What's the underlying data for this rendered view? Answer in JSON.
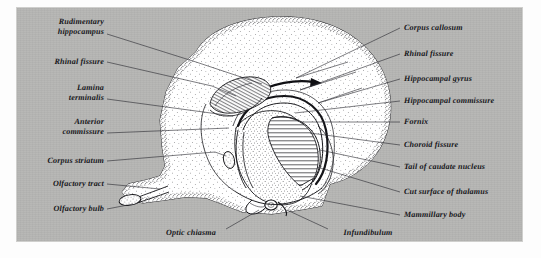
{
  "figure": {
    "plate_color": "#b6b6b4",
    "ink_color": "#16161a",
    "paper_color": "#fdfdfd"
  },
  "labels_left": [
    {
      "id": "rudimentary-hippocampus",
      "text": "Rudimentary",
      "text2": "hippocampus",
      "x": 104,
      "y": 22,
      "lx1": 107,
      "ly1": 34,
      "lx2": 196,
      "ly2": 62
    },
    {
      "id": "rhinal-fissure-left",
      "text": "Rhinal  fissure",
      "text2": "",
      "x": 104,
      "y": 62,
      "lx1": 107,
      "ly1": 62,
      "lx2": 212,
      "ly2": 86
    },
    {
      "id": "lamina-terminalis",
      "text": "Lamina",
      "text2": "terminalis",
      "x": 104,
      "y": 88,
      "lx1": 107,
      "ly1": 99,
      "lx2": 233,
      "ly2": 116
    },
    {
      "id": "anterior-commissure",
      "text": "Anterior",
      "text2": "commissure",
      "x": 104,
      "y": 122,
      "lx1": 107,
      "ly1": 133,
      "lx2": 229,
      "ly2": 128
    },
    {
      "id": "corpus-striatum",
      "text": "Corpus  striatum",
      "text2": "",
      "x": 104,
      "y": 161,
      "lx1": 107,
      "ly1": 161,
      "lx2": 215,
      "ly2": 152
    },
    {
      "id": "olfactory-tract",
      "text": "Olfactory  tract",
      "text2": "",
      "x": 104,
      "y": 184,
      "lx1": 107,
      "ly1": 184,
      "lx2": 160,
      "ly2": 189
    },
    {
      "id": "olfactory-bulb",
      "text": "Olfactory  bulb",
      "text2": "",
      "x": 104,
      "y": 210,
      "lx1": 107,
      "ly1": 209,
      "lx2": 133,
      "ly2": 204
    }
  ],
  "labels_right": [
    {
      "id": "corpus-callosum",
      "text": "Corpus callosum",
      "x": 404,
      "y": 28,
      "lx1": 400,
      "ly1": 28,
      "lx2": 296,
      "ly2": 78
    },
    {
      "id": "rhinal-fissure-right",
      "text": "Rhinal fissure",
      "x": 404,
      "y": 54,
      "lx1": 400,
      "ly1": 54,
      "lx2": 300,
      "ly2": 90
    },
    {
      "id": "hippocampal-gyrus",
      "text": "Hippocampal gyrus",
      "x": 404,
      "y": 79,
      "lx1": 400,
      "ly1": 79,
      "lx2": 318,
      "ly2": 103
    },
    {
      "id": "hippocampal-commissure",
      "text": "Hippocampal commissure",
      "x": 404,
      "y": 101,
      "lx1": 400,
      "ly1": 101,
      "lx2": 295,
      "ly2": 113
    },
    {
      "id": "fornix",
      "text": "Fornix",
      "x": 404,
      "y": 122,
      "lx1": 400,
      "ly1": 122,
      "lx2": 300,
      "ly2": 122
    },
    {
      "id": "choroid-fissure",
      "text": "Choroid fissure",
      "x": 404,
      "y": 145,
      "lx1": 400,
      "ly1": 145,
      "lx2": 310,
      "ly2": 133
    },
    {
      "id": "tail-of-caudate-nucleus",
      "text": "Tail of caudate nucleus",
      "x": 404,
      "y": 167,
      "lx1": 400,
      "ly1": 167,
      "lx2": 320,
      "ly2": 150
    },
    {
      "id": "cut-surface-of-thalamus",
      "text": "Cut surface of thalamus",
      "x": 404,
      "y": 192,
      "lx1": 400,
      "ly1": 192,
      "lx2": 317,
      "ly2": 167
    },
    {
      "id": "mammillary-body",
      "text": "Mammillary body",
      "x": 404,
      "y": 215,
      "lx1": 400,
      "ly1": 215,
      "lx2": 300,
      "ly2": 196
    }
  ],
  "labels_bottom": [
    {
      "id": "optic-chiasma",
      "text": "Optic chiasma",
      "x": 191,
      "y": 233,
      "lx1": 226,
      "ly1": 229,
      "lx2": 259,
      "ly2": 210
    },
    {
      "id": "infundibulum",
      "text": "Infundibulum",
      "x": 332,
      "y": 233,
      "lx1": 328,
      "ly1": 229,
      "lx2": 287,
      "ly2": 210
    }
  ],
  "diagram": {
    "type": "anatomical-illustration",
    "view": "medial sagittal section",
    "regions": [
      "cerebral hemisphere cortex",
      "corpus callosum",
      "fornix",
      "thalamus (hatched cut surface)",
      "corpus striatum",
      "olfactory bulb and tract",
      "optic chiasma",
      "mammillary body",
      "infundibulum"
    ]
  }
}
